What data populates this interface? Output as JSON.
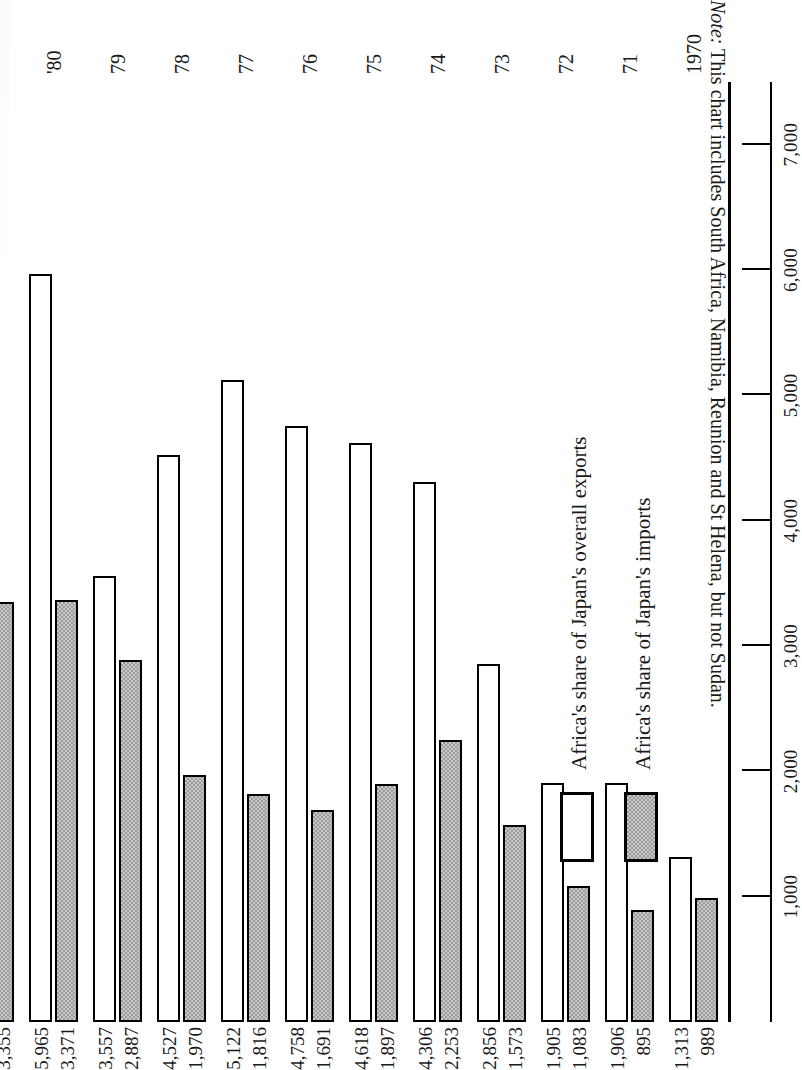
{
  "chart_data": {
    "type": "bar",
    "title": "",
    "subtitle": "",
    "orientation": "horizontal-rotated",
    "xlabel": "",
    "ylabel": "",
    "value_axis_ticks": [
      "1,000",
      "2,000",
      "3,000",
      "4,000",
      "5,000",
      "6,000",
      "7,000"
    ],
    "value_axis_tick_values": [
      1000,
      2000,
      3000,
      4000,
      5000,
      6000,
      7000
    ],
    "xlim": [
      0,
      7500
    ],
    "grid": false,
    "legend_position": "inside-lower-left",
    "categories": [
      "1970",
      "71",
      "72",
      "73",
      "74",
      "75",
      "76",
      "77",
      "78",
      "79",
      "'80",
      "'81",
      "'82",
      "'83"
    ],
    "series": [
      {
        "name": "Africa's share of Japan's overall exports",
        "style": "white",
        "values": [
          1313,
          1906,
          1905,
          2856,
          4306,
          4618,
          4758,
          5122,
          4527,
          3557,
          5965,
          7224,
          4899,
          3813
        ],
        "labels": [
          "1,313",
          "1,906",
          "1,905",
          "2,856",
          "4,306",
          "4,618",
          "4,758",
          "5,122",
          "4,527",
          "3,557",
          "5,965",
          "7,224",
          "4,899",
          "3,813"
        ]
      },
      {
        "name": "Africa's share of Japan's imports",
        "style": "stippled-gray",
        "values": [
          989,
          895,
          1083,
          1573,
          2253,
          1897,
          1691,
          1816,
          1970,
          2887,
          3371,
          3355,
          2848,
          2482
        ],
        "labels": [
          "989",
          "895",
          "1,083",
          "1,573",
          "2,253",
          "1,897",
          "1,691",
          "1,816",
          "1,970",
          "2,887",
          "3,371",
          "3,355",
          "2,848",
          "2,482"
        ]
      }
    ]
  },
  "legend": {
    "items": [
      {
        "label": "Africa's share of Japan's overall exports",
        "style": "exports"
      },
      {
        "label": "Africa's share of Japan's imports",
        "style": "imports"
      }
    ]
  },
  "note": {
    "label": "Note:",
    "text": " This chart includes South Africa, Namibia, Reunion and St Helena, but not Sudan."
  },
  "colors": {
    "ink": "#1a1a1a",
    "rule": "#000000",
    "exports_fill": "#ffffff",
    "imports_fill": "#c9c9c9",
    "imports_stipple": "#9a9a9a",
    "page": "#ffffff"
  }
}
